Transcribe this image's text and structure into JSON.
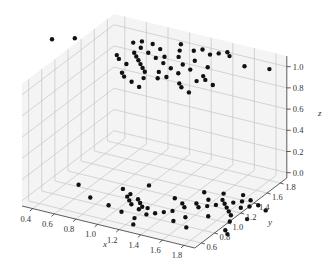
{
  "chart_data": {
    "type": "scatter3d",
    "title": "",
    "xlabel": "x",
    "ylabel": "y",
    "zlabel": "z",
    "xlim": [
      0.3,
      1.9
    ],
    "ylim": [
      0.5,
      1.9
    ],
    "zlim": [
      -0.05,
      1.1
    ],
    "x_ticks": [
      "0.4",
      "0.6",
      "0.8",
      "1.0",
      "1.2",
      "1.4",
      "1.6",
      "1.8"
    ],
    "y_ticks": [
      "0.6",
      "0.8",
      "1.0",
      "1.2",
      "1.4",
      "1.6",
      "1.8"
    ],
    "z_ticks": [
      "0.0",
      "0.2",
      "0.4",
      "0.6",
      "0.8",
      "1.0"
    ],
    "grid": true,
    "marker_color": "#111111",
    "series": [
      {
        "name": "cluster z=1",
        "points": [
          [
            0.45,
            1.45,
            1.0
          ],
          [
            0.6,
            1.55,
            1.0
          ],
          [
            1.05,
            1.7,
            1.0
          ],
          [
            1.1,
            1.75,
            1.0
          ],
          [
            1.15,
            1.65,
            1.0
          ],
          [
            1.2,
            1.75,
            1.0
          ],
          [
            1.25,
            1.6,
            1.0
          ],
          [
            1.3,
            1.7,
            1.0
          ],
          [
            1.15,
            1.55,
            1.0
          ],
          [
            1.2,
            1.5,
            1.0
          ],
          [
            1.25,
            1.45,
            1.0
          ],
          [
            1.3,
            1.4,
            1.0
          ],
          [
            1.35,
            1.55,
            1.0
          ],
          [
            1.4,
            1.85,
            1.0
          ],
          [
            1.45,
            1.75,
            1.0
          ],
          [
            1.5,
            1.65,
            1.0
          ],
          [
            1.4,
            1.6,
            1.0
          ],
          [
            1.45,
            1.5,
            1.0
          ],
          [
            1.35,
            1.35,
            1.0
          ],
          [
            1.4,
            1.3,
            1.0
          ],
          [
            1.5,
            1.35,
            1.0
          ],
          [
            1.55,
            1.45,
            1.0
          ],
          [
            1.6,
            1.55,
            1.0
          ],
          [
            1.65,
            1.65,
            1.0
          ],
          [
            1.55,
            1.8,
            1.0
          ],
          [
            1.6,
            1.85,
            1.0
          ],
          [
            1.7,
            1.8,
            1.0
          ],
          [
            1.75,
            1.85,
            1.0
          ],
          [
            1.8,
            1.9,
            1.0
          ],
          [
            1.85,
            1.85,
            1.0
          ],
          [
            1.7,
            1.5,
            1.0
          ],
          [
            1.8,
            1.6,
            1.0
          ],
          [
            1.85,
            1.45,
            1.0
          ],
          [
            1.9,
            1.4,
            1.0
          ],
          [
            1.85,
            1.35,
            1.0
          ],
          [
            1.6,
            1.3,
            1.0
          ],
          [
            1.55,
            1.25,
            1.0
          ],
          [
            1.45,
            1.2,
            1.0
          ],
          [
            1.3,
            1.15,
            1.0
          ],
          [
            1.25,
            1.2,
            1.0
          ],
          [
            1.4,
            1.1,
            1.0
          ],
          [
            1.5,
            1.05,
            1.0
          ],
          [
            1.75,
            1.25,
            1.0
          ],
          [
            1.8,
            1.2,
            1.0
          ],
          [
            1.9,
            1.15,
            1.0
          ],
          [
            2.0,
            1.35,
            1.0
          ],
          [
            1.65,
            1.4,
            1.0
          ],
          [
            1.05,
            1.45,
            1.0
          ],
          [
            1.1,
            1.4,
            1.0
          ],
          [
            1.2,
            1.35,
            1.0
          ],
          [
            2.05,
            1.75,
            1.0
          ],
          [
            2.25,
            1.8,
            1.0
          ]
        ]
      },
      {
        "name": "cluster z=0",
        "points": [
          [
            0.55,
            0.95,
            0.0
          ],
          [
            0.75,
            0.8,
            0.0
          ],
          [
            0.9,
            1.05,
            0.0
          ],
          [
            1.0,
            1.0,
            0.0
          ],
          [
            1.0,
            0.95,
            0.0
          ],
          [
            1.05,
            0.9,
            0.0
          ],
          [
            1.1,
            0.95,
            0.0
          ],
          [
            1.1,
            0.85,
            0.0
          ],
          [
            1.15,
            0.9,
            0.0
          ],
          [
            1.2,
            0.85,
            0.0
          ],
          [
            1.2,
            0.8,
            0.0
          ],
          [
            1.25,
            0.85,
            0.0
          ],
          [
            1.05,
            1.2,
            0.0
          ],
          [
            0.95,
            0.75,
            0.0
          ],
          [
            1.1,
            0.7,
            0.0
          ],
          [
            1.25,
            0.65,
            0.0
          ],
          [
            1.3,
            0.75,
            0.0
          ],
          [
            1.35,
            0.8,
            0.0
          ],
          [
            1.4,
            0.85,
            0.0
          ],
          [
            1.45,
            0.9,
            0.0
          ],
          [
            1.5,
            1.0,
            0.0
          ],
          [
            1.55,
            1.1,
            0.0
          ],
          [
            1.6,
            1.2,
            0.0
          ],
          [
            1.45,
            1.05,
            0.0
          ],
          [
            1.6,
            1.05,
            0.0
          ],
          [
            1.65,
            1.1,
            0.0
          ],
          [
            1.7,
            1.15,
            0.0
          ],
          [
            1.7,
            1.25,
            0.0
          ],
          [
            1.75,
            1.2,
            0.0
          ],
          [
            1.8,
            1.15,
            0.0
          ],
          [
            1.85,
            1.1,
            0.0
          ],
          [
            1.8,
            1.25,
            0.0
          ],
          [
            1.85,
            1.3,
            0.0
          ],
          [
            1.9,
            1.2,
            0.0
          ],
          [
            1.95,
            1.25,
            0.0
          ],
          [
            2.0,
            1.3,
            0.0
          ],
          [
            1.9,
            1.05,
            0.0
          ],
          [
            1.75,
            0.95,
            0.0
          ],
          [
            1.6,
            0.85,
            0.0
          ],
          [
            1.55,
            0.75,
            0.0
          ],
          [
            1.7,
            0.7,
            0.0
          ],
          [
            1.95,
            0.95,
            0.0
          ],
          [
            2.05,
            1.05,
            0.0
          ],
          [
            2.1,
            1.25,
            0.0
          ],
          [
            2.0,
            0.8,
            0.0
          ],
          [
            2.05,
            0.75,
            0.0
          ],
          [
            1.8,
            1.4,
            0.0
          ],
          [
            1.5,
            1.3,
            0.0
          ],
          [
            1.35,
            1.1,
            0.0
          ],
          [
            1.3,
            0.55,
            0.0
          ],
          [
            1.65,
            1.35,
            0.0
          ],
          [
            1.9,
            1.35,
            0.0
          ]
        ]
      }
    ]
  },
  "figure": {
    "width": 331,
    "height": 269
  }
}
